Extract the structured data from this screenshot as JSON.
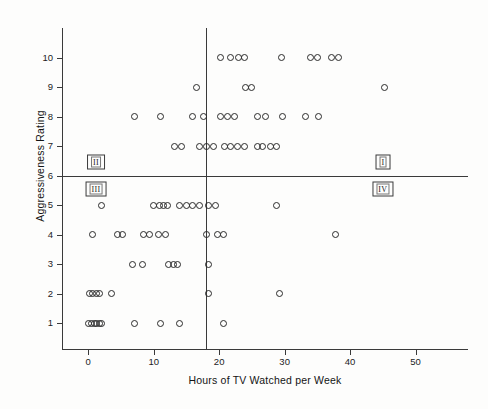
{
  "chart_data": {
    "type": "scatter",
    "title": "",
    "xlabel": "Hours of TV Watched per Week",
    "ylabel": "Aggressiveness Rating",
    "xlim": [
      -4,
      58
    ],
    "ylim": [
      0.1,
      11.0
    ],
    "xticks": [
      0,
      10,
      20,
      30,
      40,
      50
    ],
    "yticks": [
      1,
      2,
      3,
      4,
      5,
      6,
      7,
      8,
      9,
      10
    ],
    "grid": false,
    "legend": null,
    "reference_lines": [
      {
        "name": "horizontal-median-line",
        "orientation": "horizontal",
        "value": 6
      },
      {
        "name": "vertical-median-line",
        "orientation": "vertical",
        "value": 18
      }
    ],
    "quadrant_labels": [
      {
        "name": "quadrant-I",
        "text": "I",
        "x": 45.0,
        "y": 6.45
      },
      {
        "name": "quadrant-II",
        "text": "II",
        "x": 1.2,
        "y": 6.45
      },
      {
        "name": "quadrant-III",
        "text": "III",
        "x": 1.2,
        "y": 5.55
      },
      {
        "name": "quadrant-IV",
        "text": "IV",
        "x": 45.0,
        "y": 5.55
      }
    ],
    "points": [
      [
        20.2,
        10
      ],
      [
        21.8,
        10
      ],
      [
        22.9,
        10
      ],
      [
        23.9,
        10
      ],
      [
        29.5,
        10
      ],
      [
        33.9,
        10
      ],
      [
        35.0,
        10
      ],
      [
        37.2,
        10
      ],
      [
        38.3,
        10
      ],
      [
        24.0,
        9
      ],
      [
        24.9,
        9
      ],
      [
        45.3,
        9
      ],
      [
        16.5,
        9
      ],
      [
        11.0,
        8
      ],
      [
        16.0,
        8
      ],
      [
        17.6,
        8
      ],
      [
        20.2,
        8
      ],
      [
        21.3,
        8
      ],
      [
        22.3,
        8
      ],
      [
        25.9,
        8
      ],
      [
        27.0,
        8
      ],
      [
        29.6,
        8
      ],
      [
        33.2,
        8
      ],
      [
        35.1,
        8
      ],
      [
        7.0,
        8
      ],
      [
        13.2,
        7
      ],
      [
        14.2,
        7
      ],
      [
        17.0,
        7
      ],
      [
        18.0,
        7
      ],
      [
        19.2,
        7
      ],
      [
        20.8,
        7
      ],
      [
        21.8,
        7
      ],
      [
        22.8,
        7
      ],
      [
        23.8,
        7
      ],
      [
        25.9,
        7
      ],
      [
        26.6,
        7
      ],
      [
        27.8,
        7
      ],
      [
        28.8,
        7
      ],
      [
        2.0,
        5
      ],
      [
        10.0,
        5
      ],
      [
        10.9,
        5
      ],
      [
        11.5,
        5
      ],
      [
        12.1,
        5
      ],
      [
        14.0,
        5
      ],
      [
        15.0,
        5
      ],
      [
        16.0,
        5
      ],
      [
        17.0,
        5
      ],
      [
        18.4,
        5
      ],
      [
        19.4,
        5
      ],
      [
        28.8,
        5
      ],
      [
        0.6,
        4
      ],
      [
        4.5,
        4
      ],
      [
        5.2,
        4
      ],
      [
        8.5,
        4
      ],
      [
        9.3,
        4
      ],
      [
        10.8,
        4
      ],
      [
        11.8,
        4
      ],
      [
        18.0,
        4
      ],
      [
        19.7,
        4
      ],
      [
        20.7,
        4
      ],
      [
        37.7,
        4
      ],
      [
        6.8,
        3
      ],
      [
        8.3,
        3
      ],
      [
        12.3,
        3
      ],
      [
        13.1,
        3
      ],
      [
        13.7,
        3
      ],
      [
        18.4,
        3
      ],
      [
        0.2,
        2
      ],
      [
        0.7,
        2
      ],
      [
        1.2,
        2
      ],
      [
        1.7,
        2
      ],
      [
        3.6,
        2
      ],
      [
        18.3,
        2
      ],
      [
        29.2,
        2
      ],
      [
        0.1,
        1
      ],
      [
        0.5,
        1
      ],
      [
        0.9,
        1
      ],
      [
        1.3,
        1
      ],
      [
        1.7,
        1
      ],
      [
        2.1,
        1
      ],
      [
        7.0,
        1
      ],
      [
        11.1,
        1
      ],
      [
        14.0,
        1
      ],
      [
        20.7,
        1
      ]
    ]
  }
}
